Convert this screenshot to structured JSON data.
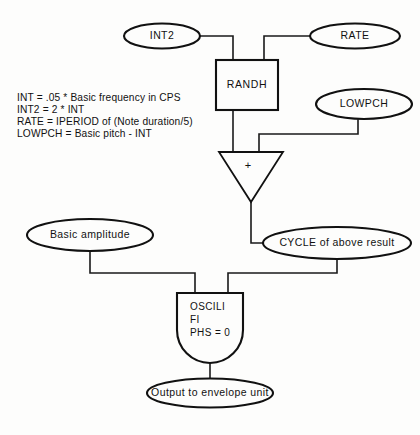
{
  "diagram": {
    "colors": {
      "background": "#fdfdfc",
      "stroke": "#111111",
      "wire": "#1a1a1a"
    },
    "legend": {
      "lines": [
        "INT = .05 * Basic frequency in CPS",
        "INT2 = 2 * INT",
        "RATE = IPERIOD  of (Note duration/5)",
        "LOWPCH = Basic pitch - INT"
      ]
    },
    "nodes": {
      "int2": {
        "label": "INT2",
        "shape": "ellipse"
      },
      "rate": {
        "label": "RATE",
        "shape": "ellipse"
      },
      "randh": {
        "label": "RANDH",
        "shape": "rectangle"
      },
      "lowpch": {
        "label": "LOWPCH",
        "shape": "ellipse"
      },
      "adder": {
        "label": "+",
        "shape": "triangle"
      },
      "basic_amplitude": {
        "label": "Basic amplitude",
        "shape": "ellipse"
      },
      "cycle": {
        "label": "CYCLE of above result",
        "shape": "ellipse"
      },
      "oscillator": {
        "shape": "bullet",
        "lines": [
          "OSCILI",
          "FI",
          "PHS = 0"
        ]
      },
      "output": {
        "label": "Output to envelope unit",
        "shape": "ellipse"
      }
    }
  }
}
